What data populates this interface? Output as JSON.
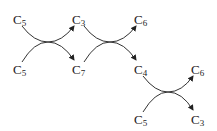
{
  "diagram": {
    "type": "reaction-scheme",
    "nodes": [
      {
        "id": "n1",
        "base": "C",
        "sub": "5",
        "x": 13,
        "y": 13
      },
      {
        "id": "n2",
        "base": "C",
        "sub": "5",
        "x": 13,
        "y": 63
      },
      {
        "id": "n3",
        "base": "C",
        "sub": "3",
        "x": 72,
        "y": 13
      },
      {
        "id": "n4",
        "base": "C",
        "sub": "7",
        "x": 72,
        "y": 63
      },
      {
        "id": "n5",
        "base": "C",
        "sub": "6",
        "x": 134,
        "y": 13
      },
      {
        "id": "n6",
        "base": "C",
        "sub": "4",
        "x": 134,
        "y": 63
      },
      {
        "id": "n7",
        "base": "C",
        "sub": "6",
        "x": 191,
        "y": 63
      },
      {
        "id": "n8",
        "base": "C",
        "sub": "5",
        "x": 134,
        "y": 113
      },
      {
        "id": "n9",
        "base": "C",
        "sub": "3",
        "x": 191,
        "y": 113
      }
    ],
    "reactions": [
      {
        "inputs": [
          "C5",
          "C5"
        ],
        "outputs": [
          "C3",
          "C7"
        ]
      },
      {
        "inputs": [
          "C3",
          "C7"
        ],
        "outputs": [
          "C6",
          "C4"
        ]
      },
      {
        "inputs": [
          "C4",
          "C5"
        ],
        "outputs": [
          "C6",
          "C3"
        ]
      }
    ]
  }
}
